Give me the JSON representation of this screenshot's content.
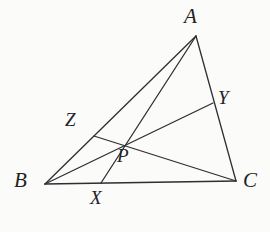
{
  "figure": {
    "type": "geometry-diagram",
    "background_color": "#fbfbfa",
    "stroke_color": "#2e2e33",
    "width": 270,
    "height": 232
  },
  "labels": {
    "A": "A",
    "B": "B",
    "C": "C",
    "X": "X",
    "Y": "Y",
    "Z": "Z",
    "P": "P"
  },
  "points": {
    "A": {
      "x": 196,
      "y": 36
    },
    "B": {
      "x": 45,
      "y": 184
    },
    "C": {
      "x": 236,
      "y": 181
    },
    "X": {
      "x": 101,
      "y": 183
    },
    "Y": {
      "x": 213,
      "y": 103
    },
    "Z": {
      "x": 94,
      "y": 136
    },
    "P": {
      "x": 121,
      "y": 144
    }
  },
  "segments": [
    {
      "name": "side-AB",
      "from": "A",
      "to": "B",
      "width": 1.3
    },
    {
      "name": "side-BC",
      "from": "B",
      "to": "C",
      "width": 1.6
    },
    {
      "name": "side-CA",
      "from": "C",
      "to": "A",
      "width": 1.3
    },
    {
      "name": "cevian-AX",
      "from": "A",
      "to": "X",
      "width": 1.3
    },
    {
      "name": "cevian-BY",
      "from": "B",
      "to": "Y",
      "width": 1.3
    },
    {
      "name": "cevian-CZ",
      "from": "C",
      "to": "Z",
      "width": 1.3
    }
  ]
}
